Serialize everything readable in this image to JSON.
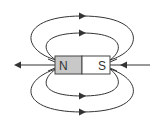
{
  "diagram": {
    "magnet": {
      "north_label": "N",
      "south_label": "S",
      "north_color": "#c8c8c8",
      "south_color": "#ffffff",
      "outline_color": "#444444"
    },
    "field_lines": {
      "color": "#333333",
      "loops": [
        {
          "name": "outer-top",
          "direction": "right"
        },
        {
          "name": "inner-top",
          "direction": "right"
        },
        {
          "name": "inner-bottom",
          "direction": "right"
        },
        {
          "name": "outer-bottom",
          "direction": "right"
        }
      ],
      "axis_arrows": [
        {
          "name": "left-axis",
          "direction": "left"
        },
        {
          "name": "right-axis",
          "direction": "left"
        }
      ]
    }
  }
}
